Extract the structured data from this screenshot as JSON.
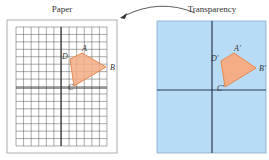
{
  "diagram": {
    "paper": {
      "title": "Paper",
      "frame": {
        "x": 7,
        "y": 20,
        "w": 110,
        "h": 133
      },
      "grid": {
        "x": 16,
        "y": 27,
        "w": 91,
        "h": 119,
        "cols": 12,
        "rows": 16
      },
      "axis_x": 61,
      "axis_y": 88,
      "quad": {
        "A": {
          "label": "A",
          "x": 82,
          "y": 53
        },
        "B": {
          "label": "B",
          "x": 106,
          "y": 67
        },
        "C": {
          "label": "C",
          "x": 74,
          "y": 86
        },
        "D": {
          "label": "D",
          "x": 70,
          "y": 59
        }
      }
    },
    "transparency": {
      "title": "Transparency",
      "frame": {
        "x": 157,
        "y": 21,
        "w": 109,
        "h": 132
      },
      "axis_x": 212,
      "axis_y": 90,
      "quad": {
        "A": {
          "label": "A′",
          "x": 234,
          "y": 53
        },
        "B": {
          "label": "B′",
          "x": 256,
          "y": 68
        },
        "C": {
          "label": "C′",
          "x": 225,
          "y": 87
        },
        "D": {
          "label": "D′",
          "x": 221,
          "y": 61
        }
      }
    },
    "arrow": {
      "from": {
        "x": 195,
        "y": 13
      },
      "to": {
        "x": 120,
        "y": 18
      }
    },
    "colors": {
      "transparency_fill": "#b9dcf6",
      "quad_fill": "#f4ad86",
      "quad_stroke": "#e8884f",
      "axis": "#2a3a55",
      "grid": "#555555",
      "frame": "#9a9a9a"
    }
  }
}
